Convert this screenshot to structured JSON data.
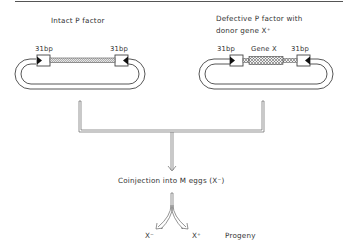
{
  "diagram": {
    "left_construct": {
      "title": "Intact P factor",
      "left_repeat": "31bp",
      "right_repeat": "31bp"
    },
    "right_construct": {
      "title_line1": "Defective P factor with",
      "title_line2": "donor gene X⁺",
      "left_repeat": "31bp",
      "insert": "Gene X",
      "right_repeat": "31bp"
    },
    "step": "Coinjection into M eggs (X⁻)",
    "outcomes": {
      "left": "X⁻",
      "right": "X⁺",
      "label": "Progeny"
    },
    "colors": {
      "line": "#555555",
      "stroke": "#333333",
      "hatch": "#777777"
    }
  }
}
